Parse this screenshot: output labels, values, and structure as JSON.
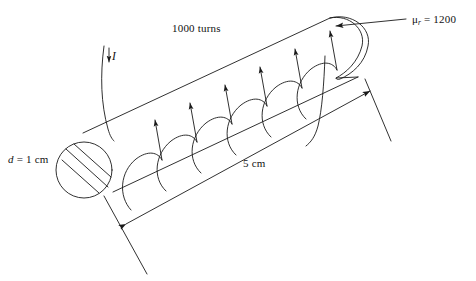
{
  "figure": {
    "background_color": "#ffffff",
    "stroke_color": "#1a1a1a",
    "text_color": "#111111",
    "width": 476,
    "height": 281
  },
  "labels": {
    "permeability": {
      "symbol": "μ",
      "subscript": "r",
      "equals": "=",
      "value": "1200"
    },
    "turns": "1000 turns",
    "current": "I",
    "diameter": {
      "symbol": "d",
      "equals": "=",
      "value": "1 cm"
    },
    "length": "5 cm"
  },
  "annotations": {
    "permeability_leader": "leader-line-to-core-end",
    "current_arrow": "downward-arrow-on-lead-wire",
    "length_dimension": "double-headed-dimension-arrow"
  },
  "geometry": {
    "core_shape": "inclined-cylinder",
    "left_end": "hatched-circular-cross-section",
    "right_end": "rounded-dome",
    "hatch_line_count": 3,
    "winding_turns_drawn": 6,
    "winding_arrow_direction": "up"
  }
}
